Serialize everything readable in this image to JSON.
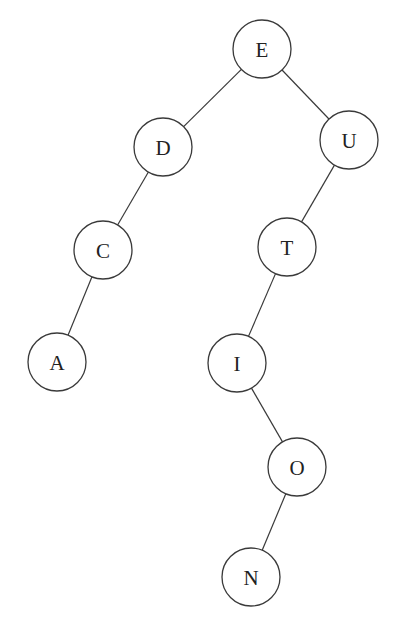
{
  "diagram": {
    "type": "binary-tree",
    "node_radius": 29,
    "nodes": [
      {
        "id": "E",
        "label": "E",
        "x": 262,
        "y": 49
      },
      {
        "id": "D",
        "label": "D",
        "x": 163,
        "y": 147
      },
      {
        "id": "U",
        "label": "U",
        "x": 349,
        "y": 140
      },
      {
        "id": "C",
        "label": "C",
        "x": 103,
        "y": 250
      },
      {
        "id": "A",
        "label": "A",
        "x": 57,
        "y": 362
      },
      {
        "id": "T",
        "label": "T",
        "x": 287,
        "y": 247
      },
      {
        "id": "I",
        "label": "I",
        "x": 237,
        "y": 363
      },
      {
        "id": "O",
        "label": "O",
        "x": 297,
        "y": 467
      },
      {
        "id": "N",
        "label": "N",
        "x": 251,
        "y": 577
      }
    ],
    "edges": [
      {
        "from": "E",
        "to": "D"
      },
      {
        "from": "E",
        "to": "U"
      },
      {
        "from": "D",
        "to": "C"
      },
      {
        "from": "C",
        "to": "A"
      },
      {
        "from": "U",
        "to": "T"
      },
      {
        "from": "T",
        "to": "I"
      },
      {
        "from": "I",
        "to": "O"
      },
      {
        "from": "O",
        "to": "N"
      }
    ]
  }
}
